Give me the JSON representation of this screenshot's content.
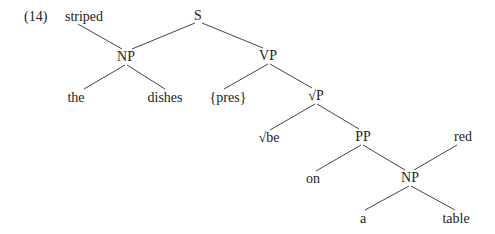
{
  "example": {
    "number": "(14)"
  },
  "tree": {
    "nodes": [
      {
        "id": "striped",
        "label": "striped",
        "x": 84,
        "y": 17
      },
      {
        "id": "S",
        "label": "S",
        "x": 198,
        "y": 16
      },
      {
        "id": "NP1",
        "label": "NP",
        "x": 126,
        "y": 57
      },
      {
        "id": "VP",
        "label": "VP",
        "x": 268,
        "y": 56
      },
      {
        "id": "the",
        "label": "the",
        "x": 76,
        "y": 98
      },
      {
        "id": "dishes",
        "label": "dishes",
        "x": 165,
        "y": 98
      },
      {
        "id": "pres",
        "label": "{pres}",
        "x": 228,
        "y": 98
      },
      {
        "id": "rootP",
        "label": "√P",
        "x": 316,
        "y": 96
      },
      {
        "id": "be",
        "label": "√be",
        "x": 269,
        "y": 138
      },
      {
        "id": "PP",
        "label": "PP",
        "x": 363,
        "y": 137
      },
      {
        "id": "red",
        "label": "red",
        "x": 463,
        "y": 137
      },
      {
        "id": "on",
        "label": "on",
        "x": 313,
        "y": 179
      },
      {
        "id": "NP2",
        "label": "NP",
        "x": 410,
        "y": 178
      },
      {
        "id": "a",
        "label": "a",
        "x": 363,
        "y": 219
      },
      {
        "id": "table",
        "label": "table",
        "x": 456,
        "y": 219
      }
    ],
    "edges": [
      {
        "from": "striped",
        "to": "NP1",
        "x1": 78,
        "y1": 24,
        "x2": 122,
        "y2": 49
      },
      {
        "from": "S",
        "to": "NP1",
        "x1": 195,
        "y1": 23,
        "x2": 132,
        "y2": 49
      },
      {
        "from": "S",
        "to": "VP",
        "x1": 202,
        "y1": 23,
        "x2": 263,
        "y2": 48
      },
      {
        "from": "NP1",
        "to": "the",
        "x1": 125,
        "y1": 65,
        "x2": 84,
        "y2": 89
      },
      {
        "from": "NP1",
        "to": "dishes",
        "x1": 127,
        "y1": 65,
        "x2": 165,
        "y2": 89
      },
      {
        "from": "VP",
        "to": "pres",
        "x1": 268,
        "y1": 64,
        "x2": 224,
        "y2": 89
      },
      {
        "from": "VP",
        "to": "rootP",
        "x1": 270,
        "y1": 64,
        "x2": 312,
        "y2": 88
      },
      {
        "from": "rootP",
        "to": "be",
        "x1": 315,
        "y1": 104,
        "x2": 270,
        "y2": 130
      },
      {
        "from": "rootP",
        "to": "PP",
        "x1": 317,
        "y1": 104,
        "x2": 359,
        "y2": 129
      },
      {
        "from": "PP",
        "to": "on",
        "x1": 361,
        "y1": 145,
        "x2": 316,
        "y2": 171
      },
      {
        "from": "PP",
        "to": "NP2",
        "x1": 363,
        "y1": 145,
        "x2": 405,
        "y2": 170
      },
      {
        "from": "red",
        "to": "NP2",
        "x1": 457,
        "y1": 145,
        "x2": 414,
        "y2": 170
      },
      {
        "from": "NP2",
        "to": "a",
        "x1": 409,
        "y1": 186,
        "x2": 365,
        "y2": 210
      },
      {
        "from": "NP2",
        "to": "table",
        "x1": 411,
        "y1": 186,
        "x2": 455,
        "y2": 210
      }
    ],
    "line_color": "#444444",
    "line_width": 1
  }
}
